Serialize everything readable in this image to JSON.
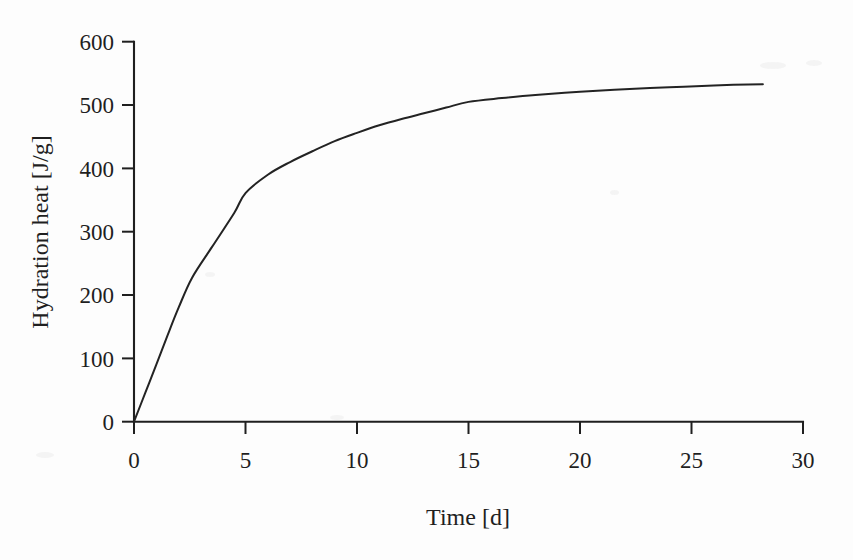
{
  "chart_data": {
    "type": "line",
    "title": "",
    "subtitle": "",
    "xlabel": "Time [d]",
    "ylabel": "Hydration heat  [J/g]",
    "xlim": [
      0,
      30
    ],
    "ylim": [
      0,
      600
    ],
    "xticks": [
      0,
      5,
      10,
      15,
      20,
      25,
      30
    ],
    "yticks": [
      0,
      100,
      200,
      300,
      400,
      500,
      600
    ],
    "xtick_labels": [
      "0",
      "5",
      "10",
      "15",
      "20",
      "25",
      "30"
    ],
    "ytick_labels": [
      "0",
      "100",
      "200",
      "300",
      "400",
      "500",
      "600"
    ],
    "grid": false,
    "legend": "none",
    "series": [
      {
        "name": "Hydration heat",
        "color": "#232323",
        "x": [
          0.0,
          0.5,
          1.0,
          1.5,
          2.0,
          2.6,
          3.5,
          4.5,
          5.0,
          6.0,
          7.0,
          8.0,
          9.0,
          10.0,
          11.0,
          12.0,
          13.0,
          14.0,
          15.0,
          16.5,
          18.0,
          20.0,
          22.0,
          24.0,
          26.0,
          28.2
        ],
        "y": [
          0,
          45,
          90,
          136,
          180,
          227,
          276,
          330,
          361,
          390,
          410,
          427,
          443,
          456,
          468,
          478,
          487,
          496,
          505,
          511,
          516,
          521,
          525,
          528,
          531,
          533
        ]
      }
    ],
    "annotations": []
  },
  "axes": {
    "y_axis_label": "Hydration heat  [J/g]",
    "x_axis_label": "Time [d]",
    "tick_direction": "outward",
    "line_color": "#1f1f1f",
    "background_color": "#fdfdfd"
  }
}
